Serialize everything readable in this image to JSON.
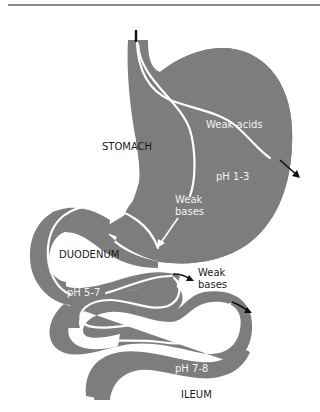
{
  "diagram": {
    "colors": {
      "organ": "#7d7d7d",
      "inner_path": "#ffffff",
      "label_dark": "#1a1a1a",
      "label_light": "#f2f2f2",
      "arrow": "#111111",
      "rule": "#8a8a8a"
    },
    "regions": [
      {
        "name": "STOMACH",
        "ph": "pH 1-3"
      },
      {
        "name": "DUODENUM",
        "ph": "pH 5-7"
      },
      {
        "name": "ILEUM",
        "ph": "pH 7-8"
      }
    ],
    "labels": {
      "stomach": "STOMACH",
      "duodenum": "DUODENUM",
      "ileum": "ILEUM",
      "ph_stomach": "pH 1-3",
      "ph_duodenum": "pH 5-7",
      "ph_ileum": "pH 7-8",
      "weak_acids": "Weak acids",
      "weak_bases_stomach_line1": "Weak",
      "weak_bases_stomach_line2": "bases",
      "weak_bases_intestine_line1": "Weak",
      "weak_bases_intestine_line2": "bases"
    },
    "nodes": [
      {
        "id": "stomach",
        "label": "STOMACH"
      },
      {
        "id": "duodenum",
        "label": "DUODENUM"
      },
      {
        "id": "ileum",
        "label": "ILEUM"
      }
    ],
    "edges": [
      {
        "from": "stomach",
        "label": "Weak acids",
        "direction": "absorbed out of stomach"
      },
      {
        "from": "stomach",
        "to": "duodenum",
        "label": "Weak bases",
        "direction": "passed to duodenum"
      },
      {
        "from": "duodenum",
        "label": "Weak bases",
        "direction": "absorbed out of intestine"
      }
    ]
  }
}
